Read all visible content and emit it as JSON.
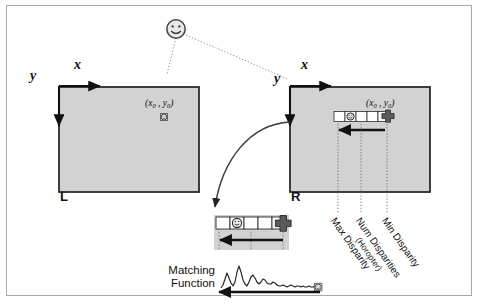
{
  "figure": {
    "frame_border_color": "#a8a8a8",
    "panel_fill_color": "#d2d2d2",
    "panel_border_color": "#2b2b2b",
    "ink_color": "#111111"
  },
  "left_panel": {
    "name_label": "L",
    "axis_x_label": "x",
    "axis_y_label": "y",
    "point_label": "(x₀ , y₀)",
    "point_x_text": "x",
    "point_x_sub": "0",
    "point_y_text": "y",
    "point_y_sub": "0"
  },
  "right_panel": {
    "name_label": "R",
    "axis_x_label": "x",
    "axis_y_label": "y",
    "point_label": "(x₀ , y₀)",
    "point_x_text": "x",
    "point_x_sub": "0",
    "point_y_text": "y",
    "point_y_sub": "0"
  },
  "scanline": {
    "cell_count": 5,
    "smiley_cell_index": 1,
    "marker_icon": "cross-marker",
    "cell_fill": "#ffffff",
    "cell_border": "#2b2b2b",
    "marker_color": "#555555"
  },
  "disparity_labels": [
    {
      "id": "min-disparity",
      "line1": "Min Disparity",
      "line2": ""
    },
    {
      "id": "num-disparities",
      "line1": "Num Disparities",
      "line2": "(Horopter)"
    },
    {
      "id": "max-disparity",
      "line1": "Max Disparity",
      "line2": ""
    }
  ],
  "matching_function": {
    "label_line1": "Matching",
    "label_line2": "Function",
    "curve_points": "0,30 2,26 4,17 6,9 8,16 10,24 12,28 14,22 16,8 18,1 20,9 22,20 24,27 26,29 28,24 30,16 32,13 34,18 36,24 38,27 40,24 42,19 44,21 46,25 48,27 50,26 52,23 54,25 56,28 58,30 60,29 62,27 64,29 66,31 68,30 70,28 72,30 74,31 76,30 78,29 80,31 82,30 84,31 86,31 88,30 90,31 92,31 94,30 96,31 98,31 100,31",
    "endpoint_icon": "smiley-endpoint"
  },
  "icons": {
    "object": "smiley-face-icon",
    "projection_line": "dotted-projection-line",
    "search_arrow": "left-search-arrow",
    "zoom_arrow": "curved-zoom-arrow"
  }
}
